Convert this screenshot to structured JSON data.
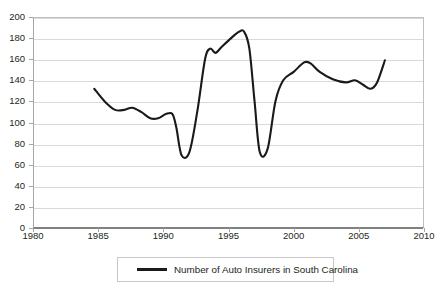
{
  "chart_data": {
    "type": "line",
    "title": "",
    "xlabel": "",
    "ylabel": "",
    "xlim": [
      1980,
      2010
    ],
    "ylim": [
      0,
      200
    ],
    "grid": "horizontal",
    "legend_position": "bottom-center",
    "x_ticks": [
      1980,
      1985,
      1990,
      1995,
      2000,
      2005,
      2010
    ],
    "y_ticks": [
      0,
      20,
      40,
      60,
      80,
      100,
      120,
      140,
      160,
      180,
      200
    ],
    "series": [
      {
        "name": "Number of Auto Insurers in South Carolina",
        "color": "#1a1a1a",
        "x": [
          1984.7,
          1985.5,
          1986.3,
          1987.0,
          1987.6,
          1988.3,
          1989.0,
          1989.6,
          1990.2,
          1990.7,
          1991.0,
          1991.4,
          1992.0,
          1992.6,
          1993.2,
          1993.6,
          1994.0,
          1994.5,
          1995.2,
          1995.8,
          1996.2,
          1996.6,
          1997.0,
          1997.4,
          1998.0,
          1998.6,
          1999.2,
          2000.0,
          2000.8,
          2001.3,
          2002.0,
          2003.0,
          2004.0,
          2004.7,
          2005.3,
          2005.9,
          2006.4,
          2007.0
        ],
        "values": [
          132,
          120,
          112,
          112,
          114,
          110,
          104,
          104,
          108,
          108,
          95,
          69,
          72,
          110,
          160,
          170,
          166,
          172,
          180,
          186,
          186,
          170,
          120,
          72,
          75,
          120,
          140,
          148,
          157,
          156,
          148,
          141,
          138,
          140,
          136,
          132,
          138,
          159
        ]
      }
    ]
  },
  "legend": {
    "entries": [
      {
        "label": "Number of Auto Insurers in South Carolina"
      }
    ]
  }
}
